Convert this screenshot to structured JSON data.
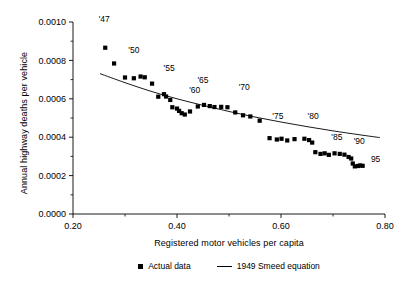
{
  "chart_data": {
    "type": "scatter",
    "title": "",
    "xlabel": "Registered motor vehicles per capita",
    "ylabel": "Annual highway deaths per vehicle",
    "xlim": [
      0.2,
      0.8
    ],
    "ylim": [
      0.0,
      0.001
    ],
    "xticks": [
      0.2,
      0.4,
      0.6,
      0.8
    ],
    "xticklabels": [
      "0.20",
      "0.40",
      "0.60",
      "0.80"
    ],
    "xminorticks": [
      0.3,
      0.5,
      0.7
    ],
    "yticks": [
      0.0,
      0.0002,
      0.0004,
      0.0006,
      0.0008,
      0.001
    ],
    "yticklabels": [
      "0.0000",
      "0.0002",
      "0.0004",
      "0.0006",
      "0.0008",
      "0.0010"
    ],
    "yminorticks": [
      0.0001,
      0.0003,
      0.0005,
      0.0007,
      0.0009
    ],
    "grid": false,
    "legend_position": "below-axes",
    "series": [
      {
        "name": "Actual data",
        "marker": "square",
        "color": "#000000",
        "points": [
          {
            "year": "1947",
            "x": 0.262,
            "y": 0.000866
          },
          {
            "year": "1948",
            "x": 0.279,
            "y": 0.000784
          },
          {
            "year": "1949",
            "x": 0.3,
            "y": 0.000711
          },
          {
            "year": "1950",
            "x": 0.317,
            "y": 0.000707
          },
          {
            "year": "1951",
            "x": 0.33,
            "y": 0.000716
          },
          {
            "year": "1952",
            "x": 0.338,
            "y": 0.000712
          },
          {
            "year": "1953",
            "x": 0.352,
            "y": 0.000679
          },
          {
            "year": "1954",
            "x": 0.364,
            "y": 0.000611
          },
          {
            "year": "1955",
            "x": 0.375,
            "y": 0.000624
          },
          {
            "year": "1956",
            "x": 0.379,
            "y": 0.000612
          },
          {
            "year": "1957",
            "x": 0.387,
            "y": 0.000594
          },
          {
            "year": "1958",
            "x": 0.391,
            "y": 0.000556
          },
          {
            "year": "1959",
            "x": 0.4,
            "y": 0.000549
          },
          {
            "year": "1960",
            "x": 0.404,
            "y": 0.000537
          },
          {
            "year": "1961",
            "x": 0.409,
            "y": 0.000525
          },
          {
            "year": "1962",
            "x": 0.415,
            "y": 0.000518
          },
          {
            "year": "1963",
            "x": 0.425,
            "y": 0.000534
          },
          {
            "year": "1964",
            "x": 0.44,
            "y": 0.00056
          },
          {
            "year": "1965",
            "x": 0.452,
            "y": 0.000568
          },
          {
            "year": "1966",
            "x": 0.463,
            "y": 0.000562
          },
          {
            "year": "1967",
            "x": 0.472,
            "y": 0.000557
          },
          {
            "year": "1968",
            "x": 0.485,
            "y": 0.000558
          },
          {
            "year": "1969",
            "x": 0.497,
            "y": 0.000556
          },
          {
            "year": "1970",
            "x": 0.512,
            "y": 0.000529
          },
          {
            "year": "1971",
            "x": 0.527,
            "y": 0.000514
          },
          {
            "year": "1972",
            "x": 0.541,
            "y": 0.000508
          },
          {
            "year": "1973",
            "x": 0.559,
            "y": 0.000486
          },
          {
            "year": "1974",
            "x": 0.578,
            "y": 0.000395
          },
          {
            "year": "1975",
            "x": 0.592,
            "y": 0.000388
          },
          {
            "year": "1976",
            "x": 0.601,
            "y": 0.000392
          },
          {
            "year": "1977",
            "x": 0.612,
            "y": 0.000383
          },
          {
            "year": "1978",
            "x": 0.626,
            "y": 0.00039
          },
          {
            "year": "1979",
            "x": 0.645,
            "y": 0.000392
          },
          {
            "year": "1980",
            "x": 0.654,
            "y": 0.000385
          },
          {
            "year": "1981",
            "x": 0.66,
            "y": 0.000372
          },
          {
            "year": "1982",
            "x": 0.666,
            "y": 0.000322
          },
          {
            "year": "1983",
            "x": 0.676,
            "y": 0.000313
          },
          {
            "year": "1984",
            "x": 0.684,
            "y": 0.000316
          },
          {
            "year": "1985",
            "x": 0.692,
            "y": 0.000308
          },
          {
            "year": "1986",
            "x": 0.703,
            "y": 0.000316
          },
          {
            "year": "1987",
            "x": 0.713,
            "y": 0.000313
          },
          {
            "year": "1988",
            "x": 0.722,
            "y": 0.000309
          },
          {
            "year": "1989",
            "x": 0.73,
            "y": 0.000297
          },
          {
            "year": "1990",
            "x": 0.735,
            "y": 0.000289
          },
          {
            "year": "1991",
            "x": 0.738,
            "y": 0.000263
          },
          {
            "year": "1992",
            "x": 0.742,
            "y": 0.000248
          },
          {
            "year": "1993",
            "x": 0.748,
            "y": 0.00025
          },
          {
            "year": "1994",
            "x": 0.752,
            "y": 0.000253
          },
          {
            "year": "1995",
            "x": 0.757,
            "y": 0.000251
          }
        ]
      },
      {
        "name": "1949 Smeed equation",
        "marker": "line",
        "color": "#000000",
        "points": [
          {
            "x": 0.252,
            "y": 0.000731
          },
          {
            "x": 0.3,
            "y": 0.000684
          },
          {
            "x": 0.35,
            "y": 0.000639
          },
          {
            "x": 0.4,
            "y": 0.0006
          },
          {
            "x": 0.45,
            "y": 0.000566
          },
          {
            "x": 0.5,
            "y": 0.000534
          },
          {
            "x": 0.55,
            "y": 0.000505
          },
          {
            "x": 0.6,
            "y": 0.000479
          },
          {
            "x": 0.65,
            "y": 0.000455
          },
          {
            "x": 0.7,
            "y": 0.000433
          },
          {
            "x": 0.75,
            "y": 0.000413
          },
          {
            "x": 0.79,
            "y": 0.000398
          }
        ]
      }
    ],
    "annotations": [
      {
        "label": "'47",
        "x": 0.262,
        "y": 0.000866,
        "dx": -1,
        "dy": 26
      },
      {
        "label": "'50",
        "x": 0.317,
        "y": 0.000707,
        "dx": 0,
        "dy": 25
      },
      {
        "label": "'55",
        "x": 0.379,
        "y": 0.000612,
        "dx": 3,
        "dy": 26
      },
      {
        "label": "'60",
        "x": 0.415,
        "y": 0.000518,
        "dx": 10,
        "dy": 22
      },
      {
        "label": "'65",
        "x": 0.452,
        "y": 0.000568,
        "dx": -1,
        "dy": 22
      },
      {
        "label": "'70",
        "x": 0.512,
        "y": 0.000529,
        "dx": 9,
        "dy": 22
      },
      {
        "label": "'75",
        "x": 0.592,
        "y": 0.000388,
        "dx": 1,
        "dy": 21
      },
      {
        "label": "'80",
        "x": 0.654,
        "y": 0.000385,
        "dx": 4,
        "dy": 21
      },
      {
        "label": "'85",
        "x": 0.692,
        "y": 0.000308,
        "dx": 8,
        "dy": 15
      },
      {
        "label": "'90",
        "x": 0.735,
        "y": 0.000289,
        "dx": 8,
        "dy": 15
      },
      {
        "label": "95",
        "x": 0.757,
        "y": 0.000251,
        "dx": 13,
        "dy": 4
      }
    ]
  },
  "legend": {
    "items": [
      {
        "label": "Actual data",
        "symbol": "square"
      },
      {
        "label": "1949 Smeed equation",
        "symbol": "line"
      }
    ]
  },
  "axes": {
    "x_title": "Registered motor vehicles per capita",
    "y_title": "Annual highway deaths per vehicle"
  }
}
